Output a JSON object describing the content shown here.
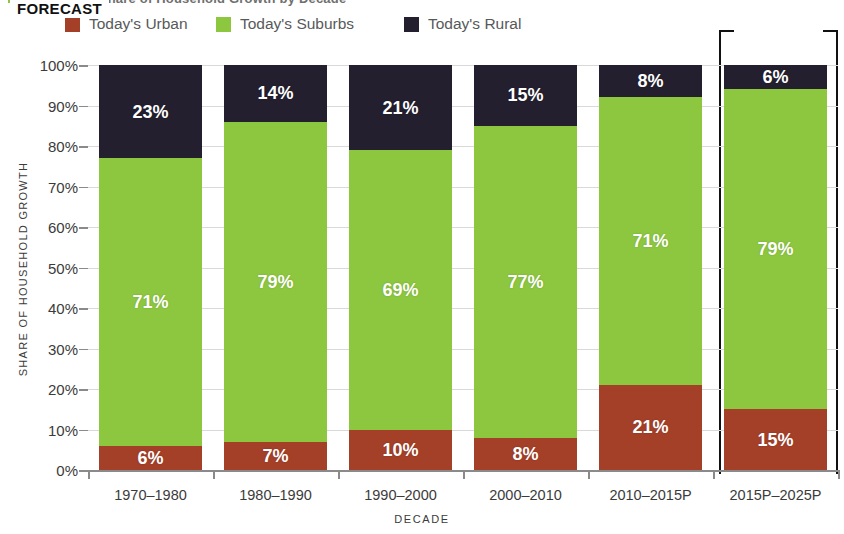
{
  "figure": {
    "title_fragment": "FIGURE 10  Share of Household Growth by Decade",
    "forecast_label": "FORECAST"
  },
  "legend": {
    "position": "top-left",
    "items": [
      {
        "label": "Today's Urban",
        "color": "#A43F28",
        "swatch": "urban-swatch"
      },
      {
        "label": "Today's Suburbs",
        "color": "#8DC63F",
        "swatch": "suburbs-swatch"
      },
      {
        "label": "Today's Rural",
        "color": "#231F2E",
        "swatch": "rural-swatch"
      }
    ]
  },
  "axes": {
    "y_title": "SHARE OF HOUSEHOLD GROWTH",
    "x_title": "DECADE",
    "y_ticks": [
      "100%",
      "90%",
      "80%",
      "70%",
      "60%",
      "50%",
      "40%",
      "30%",
      "20%",
      "10%",
      "0%"
    ]
  },
  "chart_data": {
    "type": "bar",
    "stacked": true,
    "title": "Share of Household Growth by Decade",
    "xlabel": "DECADE",
    "ylabel": "SHARE OF HOUSEHOLD GROWTH",
    "ylim": [
      0,
      100
    ],
    "ytick_labels": [
      "0%",
      "10%",
      "20%",
      "30%",
      "40%",
      "50%",
      "60%",
      "70%",
      "80%",
      "90%",
      "100%"
    ],
    "grid": true,
    "legend_position": "top-left",
    "categories": [
      "1970–1980",
      "1980–1990",
      "1990–2000",
      "2000–2010",
      "2010–2015P",
      "2015P–2025P"
    ],
    "series": [
      {
        "name": "Today's Urban",
        "color": "#A43F28",
        "values": [
          6,
          7,
          10,
          8,
          21,
          15
        ],
        "labels": [
          "6%",
          "7%",
          "10%",
          "8%",
          "21%",
          "15%"
        ]
      },
      {
        "name": "Today's Suburbs",
        "color": "#8DC63F",
        "values": [
          71,
          79,
          69,
          77,
          71,
          79
        ],
        "labels": [
          "71%",
          "79%",
          "69%",
          "77%",
          "71%",
          "79%"
        ]
      },
      {
        "name": "Today's Rural",
        "color": "#231F2E",
        "values": [
          23,
          14,
          21,
          15,
          8,
          6
        ],
        "labels": [
          "23%",
          "14%",
          "21%",
          "15%",
          "8%",
          "6%"
        ]
      }
    ],
    "bar_totals": [
      100,
      100,
      100,
      100,
      100,
      100
    ],
    "annotations": [
      {
        "text": "FORECAST",
        "covers": [
          "2015P–2025P"
        ]
      }
    ]
  }
}
